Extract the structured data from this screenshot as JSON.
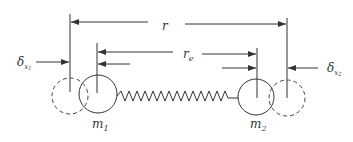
{
  "diagram": {
    "labels": {
      "r": "r",
      "re_main": "r",
      "re_sub": "e",
      "delta_left_main": "δ",
      "delta_left_sub": "x",
      "delta_left_subsub": "1",
      "delta_right_main": "δ",
      "delta_right_sub": "x",
      "delta_right_subsub": "2",
      "m1_main": "m",
      "m1_sub": "1",
      "m2_main": "m",
      "m2_sub": "2"
    },
    "elements": [
      {
        "id": "mass-1",
        "type": "solid-circle",
        "label": "m1"
      },
      {
        "id": "mass-2",
        "type": "solid-circle",
        "label": "m2"
      },
      {
        "id": "mass-1-displaced",
        "type": "dashed-circle"
      },
      {
        "id": "mass-2-displaced",
        "type": "dashed-circle"
      },
      {
        "id": "spring",
        "type": "zigzag",
        "connects": [
          "mass-1",
          "mass-2"
        ]
      }
    ],
    "colors": {
      "stroke": "#333333",
      "background": "#ffffff"
    }
  }
}
